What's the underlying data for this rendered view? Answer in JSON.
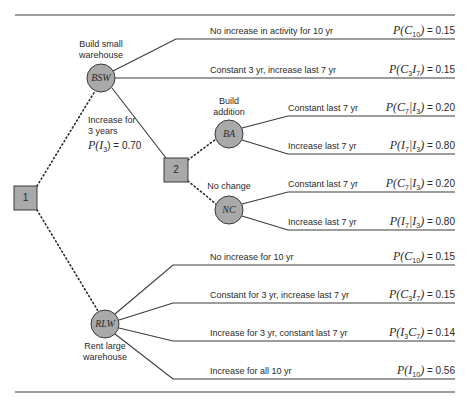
{
  "diagram": {
    "type": "decision-tree",
    "colors": {
      "node_fill": "#a9a9a9",
      "line": "#3a3a3a",
      "text": "#2a2a2a"
    },
    "decision_nodes": [
      {
        "id": "1",
        "label": "1"
      },
      {
        "id": "2",
        "label": "2"
      }
    ],
    "chance_nodes": [
      {
        "id": "BSW",
        "label": "BSW",
        "caption_line1": "Build small",
        "caption_line2": "warehouse"
      },
      {
        "id": "BA",
        "label": "BA",
        "caption_line1": "Build",
        "caption_line2": "addition"
      },
      {
        "id": "NC",
        "label": "NC",
        "caption_line1": "No change"
      },
      {
        "id": "RLW",
        "label": "RLW",
        "caption_line1": "Rent large",
        "caption_line2": "warehouse"
      }
    ],
    "bsw_to_2": {
      "line1": "Increase for",
      "line2": "3 years",
      "prob_prefix": "P(I",
      "prob_sub": "3",
      "prob_suffix": ") = 0.70"
    },
    "outcomes": [
      {
        "label": "No increase in activity for 10 yr",
        "prob_text": "P(C",
        "sub": "10",
        "rest": ")",
        "value": "= 0.15"
      },
      {
        "label": "Constant 3 yr, increase last 7 yr",
        "prob_text": "P(C",
        "sub": "3",
        "mid": "I",
        "sub2": "7",
        "rest": ")",
        "value": "= 0.15"
      },
      {
        "label": "Constant last 7 yr",
        "prob_text": "P(C",
        "sub": "7",
        "mid": "|I",
        "sub2": "3",
        "rest": ")",
        "value": "= 0.20"
      },
      {
        "label": "Increase last 7 yr",
        "prob_text": "P(I",
        "sub": "7",
        "mid": "|I",
        "sub2": "3",
        "rest": ")",
        "value": "= 0.80"
      },
      {
        "label": "Constant last 7 yr",
        "prob_text": "P(C",
        "sub": "7",
        "mid": "|I",
        "sub2": "3",
        "rest": ")",
        "value": "= 0.20"
      },
      {
        "label": "Increase last 7 yr",
        "prob_text": "P(I",
        "sub": "7",
        "mid": "|I",
        "sub2": "3",
        "rest": ")",
        "value": "= 0.80"
      },
      {
        "label": "No increase for 10 yr",
        "prob_text": "P(C",
        "sub": "10",
        "rest": ")",
        "value": "= 0.15"
      },
      {
        "label": "Constant for 3 yr, increase last 7 yr",
        "prob_text": "P(C",
        "sub": "3",
        "mid": "I",
        "sub2": "7",
        "rest": ")",
        "value": "= 0.15"
      },
      {
        "label": "Increase for 3 yr, constant last 7 yr",
        "prob_text": "P(I",
        "sub": "3",
        "mid": "C",
        "sub2": "7",
        "rest": ")",
        "value": "= 0.14"
      },
      {
        "label": "Increase for all 10 yr",
        "prob_text": "P(I",
        "sub": "10",
        "rest": ")",
        "value": "= 0.56"
      }
    ]
  }
}
